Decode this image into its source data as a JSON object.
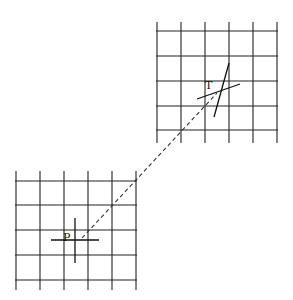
{
  "diagram": {
    "type": "grid-transformation-sketch",
    "background": "#ffffff",
    "line_color": "#222222",
    "grids": [
      {
        "id": "source-grid",
        "position": "bottom-left",
        "vertical_x": [
          16,
          40,
          64,
          88,
          112,
          136
        ],
        "horizontal_y": [
          181,
          205,
          230,
          255,
          280
        ],
        "x_span": [
          16,
          136
        ],
        "y_span": [
          171,
          290
        ]
      },
      {
        "id": "target-grid",
        "position": "top-right",
        "vertical_x": [
          157,
          181,
          205,
          229,
          253,
          277
        ],
        "horizontal_y": [
          31,
          56,
          81,
          106,
          130
        ],
        "x_span": [
          157,
          277
        ],
        "y_span": [
          22,
          143
        ]
      }
    ],
    "points": [
      {
        "label": "P",
        "meaning": "source point",
        "label_pos": [
          63,
          241
        ],
        "cross": {
          "line1": [
            51,
            240,
            99,
            240
          ],
          "line2": [
            75,
            218,
            75,
            263
          ]
        }
      },
      {
        "label": "T",
        "meaning": "transformed point",
        "label_pos": [
          205,
          89
        ],
        "cross": {
          "line1": [
            197,
            99,
            240,
            84
          ],
          "line2": [
            229,
            63,
            214,
            117
          ]
        }
      }
    ],
    "connector": {
      "style": "dashed",
      "from": [
        82,
        238
      ],
      "to": [
        217,
        93
      ]
    }
  }
}
